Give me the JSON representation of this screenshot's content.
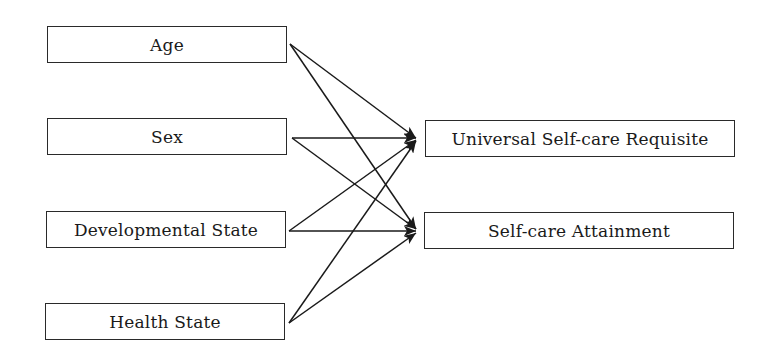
{
  "diagram": {
    "type": "path-diagram",
    "sources": [
      {
        "id": "age",
        "label": "Age"
      },
      {
        "id": "sex",
        "label": "Sex"
      },
      {
        "id": "developmental_state",
        "label": "Developmental State"
      },
      {
        "id": "health_state",
        "label": "Health State"
      }
    ],
    "targets": [
      {
        "id": "universal_self_care_requisite",
        "label": "Universal Self-care Requisite"
      },
      {
        "id": "self_care_attainment",
        "label": "Self-care Attainment"
      }
    ],
    "edges": [
      {
        "from": "age",
        "to": "universal_self_care_requisite"
      },
      {
        "from": "age",
        "to": "self_care_attainment"
      },
      {
        "from": "sex",
        "to": "universal_self_care_requisite"
      },
      {
        "from": "sex",
        "to": "self_care_attainment"
      },
      {
        "from": "developmental_state",
        "to": "universal_self_care_requisite"
      },
      {
        "from": "developmental_state",
        "to": "self_care_attainment"
      },
      {
        "from": "health_state",
        "to": "universal_self_care_requisite"
      },
      {
        "from": "health_state",
        "to": "self_care_attainment"
      }
    ],
    "colors": {
      "line": "#1a1a1a",
      "background": "#ffffff"
    }
  }
}
